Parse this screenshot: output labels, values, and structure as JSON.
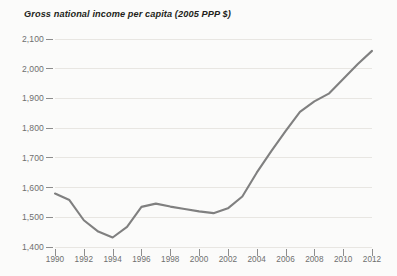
{
  "chart_data": {
    "type": "line",
    "title": "Gross national income per capita (2005 PPP $)",
    "xlabel": "",
    "ylabel": "",
    "xlim": [
      1990,
      2012
    ],
    "ylim": [
      1400,
      2100
    ],
    "yticks": [
      1400,
      1500,
      1600,
      1700,
      1800,
      1900,
      2000,
      2100
    ],
    "ytick_labels": [
      "1,400",
      "1,500",
      "1,600",
      "1,700",
      "1,800",
      "1,900",
      "2,000",
      "2,100"
    ],
    "xticks": [
      1990,
      1992,
      1994,
      1996,
      1998,
      2000,
      2002,
      2004,
      2006,
      2008,
      2010,
      2012
    ],
    "xtick_labels": [
      "1990",
      "1992",
      "1994",
      "1996",
      "1998",
      "2000",
      "2002",
      "2004",
      "2006",
      "2008",
      "2010",
      "2012"
    ],
    "grid": true,
    "grid_axis": "y",
    "legend": false,
    "legend_position": "none",
    "line_color": "#808080",
    "grid_color": "#e8e6e2",
    "background_color": "#fbfbfa",
    "text_color": "#6f6f6f",
    "title_color": "#231f20",
    "x": [
      1990,
      1991,
      1992,
      1993,
      1994,
      1995,
      1996,
      1997,
      1998,
      1999,
      2000,
      2001,
      2002,
      2003,
      2004,
      2005,
      2006,
      2007,
      2008,
      2009,
      2010,
      2011,
      2012
    ],
    "values": [
      1580,
      1558,
      1490,
      1452,
      1432,
      1468,
      1535,
      1546,
      1536,
      1528,
      1520,
      1514,
      1530,
      1570,
      1650,
      1722,
      1790,
      1855,
      1890,
      1916,
      1965,
      2015,
      2060
    ],
    "series": [
      {
        "name": "Gross national income per capita",
        "values": [
          1580,
          1558,
          1490,
          1452,
          1432,
          1468,
          1535,
          1546,
          1536,
          1528,
          1520,
          1514,
          1530,
          1570,
          1650,
          1722,
          1790,
          1855,
          1890,
          1916,
          1965,
          2015,
          2060
        ]
      }
    ]
  }
}
